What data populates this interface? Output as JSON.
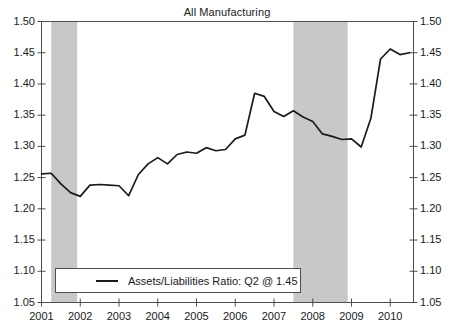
{
  "chart_data": {
    "type": "line",
    "title": "All Manufacturing",
    "xlabel": "",
    "ylabel": "",
    "ylim": [
      1.05,
      1.5
    ],
    "xlim": [
      2001.0,
      2010.6
    ],
    "grid": false,
    "legend_position": "bottom-left",
    "y_ticks": [
      "1.05",
      "1.10",
      "1.15",
      "1.20",
      "1.25",
      "1.30",
      "1.35",
      "1.40",
      "1.45",
      "1.50"
    ],
    "y_ticks_right": [
      "1.05",
      "1.10",
      "1.15",
      "1.20",
      "1.25",
      "1.30",
      "1.35",
      "1.40",
      "1.45",
      "1.50"
    ],
    "x_ticks": [
      "2001",
      "2002",
      "2003",
      "2004",
      "2005",
      "2006",
      "2007",
      "2008",
      "2009",
      "2010"
    ],
    "legend": [
      {
        "label": "Assets/Liabilities Ratio: Q2 @ 1.45",
        "color": "#1a1a1a"
      }
    ],
    "series": [
      {
        "name": "Assets/Liabilities Ratio",
        "color": "#1a1a1a",
        "x": [
          2001.0,
          2001.25,
          2001.5,
          2001.75,
          2002.0,
          2002.25,
          2002.5,
          2002.75,
          2003.0,
          2003.25,
          2003.5,
          2003.75,
          2004.0,
          2004.25,
          2004.5,
          2004.75,
          2005.0,
          2005.25,
          2005.5,
          2005.75,
          2006.0,
          2006.25,
          2006.5,
          2006.75,
          2007.0,
          2007.25,
          2007.5,
          2007.75,
          2008.0,
          2008.25,
          2008.5,
          2008.75,
          2009.0,
          2009.25,
          2009.5,
          2009.75,
          2010.0,
          2010.25,
          2010.5
        ],
        "values": [
          1.256,
          1.257,
          1.24,
          1.226,
          1.22,
          1.238,
          1.239,
          1.238,
          1.237,
          1.221,
          1.255,
          1.272,
          1.282,
          1.272,
          1.287,
          1.291,
          1.289,
          1.298,
          1.293,
          1.295,
          1.312,
          1.318,
          1.385,
          1.38,
          1.356,
          1.348,
          1.357,
          1.347,
          1.34,
          1.32,
          1.316,
          1.311,
          1.312,
          1.299,
          1.345,
          1.44,
          1.456,
          1.447,
          1.45
        ]
      }
    ],
    "shaded_regions": [
      {
        "name": "recession-2001",
        "x_start": 2001.25,
        "x_end": 2001.92,
        "color": "#c8c8c8"
      },
      {
        "name": "recession-2008",
        "x_start": 2007.5,
        "x_end": 2008.9,
        "color": "#c8c8c8"
      }
    ],
    "colors": {
      "line": "#1a1a1a",
      "axis": "#4d4d4d",
      "shading": "#c8c8c8",
      "background": "#ffffff"
    }
  }
}
